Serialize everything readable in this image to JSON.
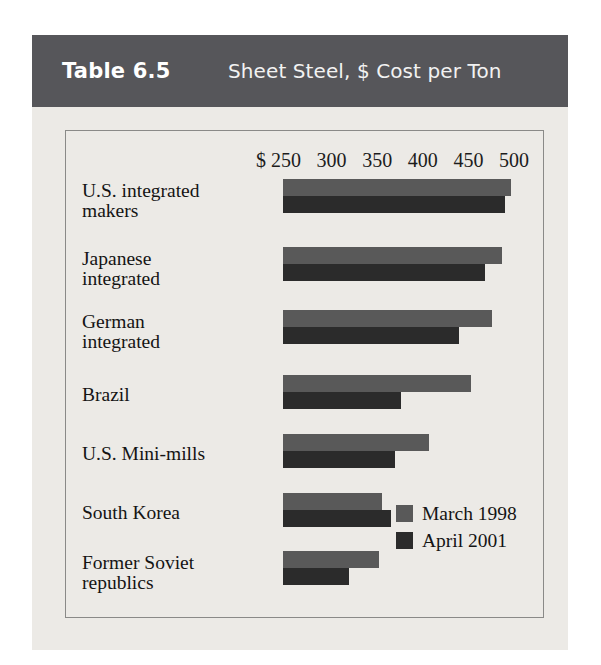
{
  "header": {
    "table_number": "Table 6.5",
    "title": "Sheet Steel, $ Cost per Ton"
  },
  "legend": {
    "series": [
      {
        "label": "March 1998",
        "color": "#595959"
      },
      {
        "label": "April 2001",
        "color": "#2b2b2b"
      }
    ]
  },
  "axis": {
    "currency_symbol": "$",
    "ticks": [
      "250",
      "300",
      "350",
      "400",
      "450",
      "500"
    ]
  },
  "chart_data": {
    "type": "bar",
    "orientation": "horizontal",
    "title": "Sheet Steel, $ Cost per Ton",
    "xlabel": "$ Cost per Ton",
    "ylabel": "",
    "xlim": [
      250,
      500
    ],
    "xticks": [
      250,
      300,
      350,
      400,
      450,
      500
    ],
    "grid": false,
    "legend_position": "bottom-right",
    "categories": [
      "U.S. integrated makers",
      "Japanese integrated",
      "German integrated",
      "Brazil",
      "U.S. Mini-mills",
      "South Korea",
      "Former Soviet republics"
    ],
    "series": [
      {
        "name": "March 1998",
        "color": "#595959",
        "values": [
          490,
          482,
          472,
          450,
          405,
          355,
          352
        ]
      },
      {
        "name": "April 2001",
        "color": "#2b2b2b",
        "values": [
          485,
          464,
          437,
          375,
          370,
          365,
          320
        ]
      }
    ]
  },
  "rows": [
    {
      "label_line1": "U.S. integrated",
      "label_line2": "makers",
      "bar_a_width": 228,
      "bar_b_width": 222
    },
    {
      "label_line1": "Japanese",
      "label_line2": "integrated",
      "bar_a_width": 219,
      "bar_b_width": 202
    },
    {
      "label_line1": "German",
      "label_line2": "integrated",
      "bar_a_width": 209,
      "bar_b_width": 176
    },
    {
      "label_line1": "Brazil",
      "label_line2": "",
      "bar_a_width": 188,
      "bar_b_width": 118
    },
    {
      "label_line1": "U.S. Mini-mills",
      "label_line2": "",
      "bar_a_width": 146,
      "bar_b_width": 112
    },
    {
      "label_line1": "South Korea",
      "label_line2": "",
      "bar_a_width": 99,
      "bar_b_width": 108
    },
    {
      "label_line1": "Former Soviet",
      "label_line2": "republics",
      "bar_a_width": 96,
      "bar_b_width": 66
    }
  ]
}
